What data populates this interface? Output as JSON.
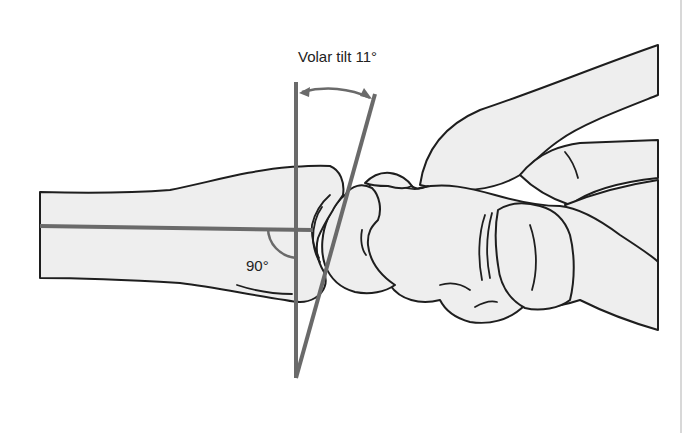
{
  "diagram": {
    "title": "Volar tilt 11°",
    "angle_label": "90°",
    "measurement": {
      "name": "Volar tilt",
      "value_degrees": 11,
      "reference_angle_degrees": 90
    },
    "colors": {
      "bone_fill": "#eeeeee",
      "outline": "#1e1e1e",
      "reference_lines": "#6a6a6a",
      "background": "#ffffff",
      "page_edge": "#d8d8d8"
    }
  }
}
